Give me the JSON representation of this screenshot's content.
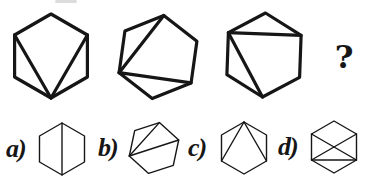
{
  "style": {
    "ink": "#161616",
    "background": "#ffffff",
    "sequence_stroke_width": 3.2,
    "option_stroke_width": 1.4
  },
  "question_mark": "?",
  "sequence_figures": [
    {
      "id": "seq-1",
      "rotation": 0,
      "chords": [
        [
          "UL",
          "B"
        ],
        [
          "UR",
          "B"
        ]
      ]
    },
    {
      "id": "seq-2",
      "rotation": -8,
      "chords": [
        [
          "T",
          "LL"
        ],
        [
          "LL",
          "LR"
        ]
      ]
    },
    {
      "id": "seq-3",
      "rotation": -2,
      "chords": [
        [
          "UL",
          "UR"
        ],
        [
          "UL",
          "B"
        ]
      ]
    }
  ],
  "answer_options": [
    {
      "id": "opt-a",
      "label": "a)",
      "rotation": 0,
      "chords": [
        [
          "T",
          "B"
        ]
      ]
    },
    {
      "id": "opt-b",
      "label": "b)",
      "rotation": -12,
      "chords": [
        [
          "LL",
          "T"
        ],
        [
          "LL",
          "UR"
        ]
      ]
    },
    {
      "id": "opt-c",
      "label": "c)",
      "rotation": 0,
      "chords": [
        [
          "T",
          "LL"
        ],
        [
          "T",
          "LR"
        ]
      ]
    },
    {
      "id": "opt-d",
      "label": "d)",
      "rotation": 0,
      "chords": [
        [
          "UL",
          "LR"
        ],
        [
          "UR",
          "LL"
        ],
        [
          "LL",
          "LR"
        ]
      ]
    }
  ]
}
